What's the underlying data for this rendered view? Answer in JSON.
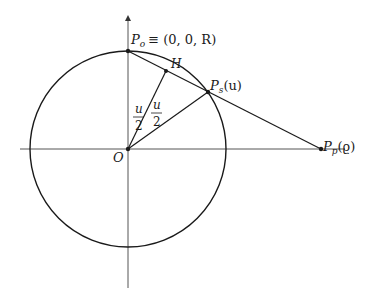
{
  "diagram": {
    "type": "geometry",
    "colors": {
      "stroke": "#1a1a1a",
      "axis": "#555555",
      "background": "#ffffff"
    },
    "labels": {
      "north_pole": "P",
      "north_pole_sub": "o",
      "north_pole_coords": "≡ (0, 0, R)",
      "sphere_point": "P",
      "sphere_point_sub": "s",
      "sphere_point_arg": "(u)",
      "plane_point": "P",
      "plane_point_sub": "p",
      "plane_point_arg": "(ϱ)",
      "midpoint": "H",
      "origin": "O",
      "half_angle_numerator": "u",
      "half_angle_denominator": "2"
    },
    "points": {
      "origin": [
        128,
        149
      ],
      "north_pole": [
        128,
        51
      ],
      "sphere_point": [
        208,
        92
      ],
      "plane_point": [
        321,
        149
      ],
      "midpoint_H": [
        166,
        71
      ]
    },
    "circle": {
      "cx": 128,
      "cy": 149,
      "r": 98
    }
  }
}
